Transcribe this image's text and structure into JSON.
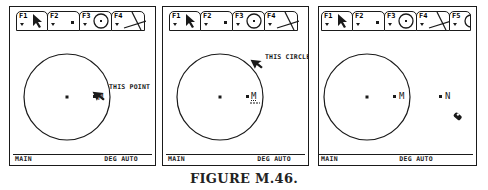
{
  "figure_caption": "FIGURE M.46.",
  "toolbar": {
    "tabs": [
      {
        "key": "F1",
        "icon": "pointer-arrow-icon"
      },
      {
        "key": "F2",
        "icon": "point-icon"
      },
      {
        "key": "F3",
        "icon": "circle-icon"
      },
      {
        "key": "F4",
        "icon": "lines-icon"
      },
      {
        "key": "F5",
        "icon": "partial-tab-icon"
      }
    ]
  },
  "status_bar": {
    "left": "MAIN",
    "right": "DEG AUTO"
  },
  "panels": [
    {
      "id": "panel-1",
      "tooltip": "THIS POINT",
      "point_labels": [
        "M"
      ],
      "cursor": "pointer-arrow-icon"
    },
    {
      "id": "panel-2",
      "tooltip": "THIS CIRCLE",
      "point_labels": [
        "M"
      ],
      "cursor": "pointer-arrow-icon"
    },
    {
      "id": "panel-3",
      "tooltip": "",
      "point_labels": [
        "M",
        "N"
      ],
      "cursor": "pencil-cursor-icon"
    }
  ],
  "colors": {
    "ink": "#1a1a1a",
    "background": "#ffffff"
  }
}
